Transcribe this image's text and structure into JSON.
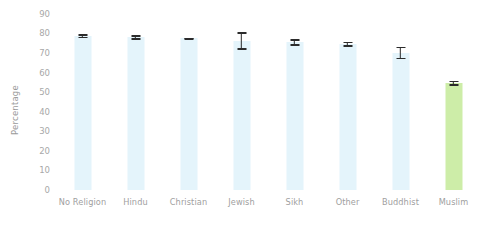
{
  "chart_data": {
    "type": "bar",
    "title": "",
    "subtitle": "",
    "xlabel": "",
    "ylabel": "Percentage",
    "ylim": [
      0,
      93
    ],
    "yticks": [
      0,
      10,
      20,
      30,
      40,
      50,
      60,
      70,
      80,
      90
    ],
    "ytick_labels": [
      "0",
      "10",
      "20",
      "30",
      "40",
      "50",
      "60",
      "70",
      "80",
      "90"
    ],
    "grid": false,
    "legend": "none",
    "categories": [
      "No Religion",
      "Hindu",
      "Christian",
      "Jewish",
      "Sikh",
      "Other",
      "Buddhist",
      "Muslim"
    ],
    "values": [
      78.5,
      78.0,
      77.5,
      76.0,
      75.5,
      74.5,
      70.0,
      54.5
    ],
    "error_low": [
      77.5,
      76.8,
      77.1,
      71.5,
      73.8,
      73.2,
      66.8,
      53.2
    ],
    "error_high": [
      79.5,
      79.2,
      77.9,
      80.5,
      77.2,
      75.8,
      73.2,
      55.8
    ],
    "bar_colors": [
      "#e4f4fb",
      "#e4f4fb",
      "#e4f4fb",
      "#e4f4fb",
      "#e4f4fb",
      "#e4f4fb",
      "#e4f4fb",
      "#cdeda8"
    ],
    "accent_color": "#cdeda8",
    "bar_color": "#e4f4fb",
    "errorbar_color": "#2b2b2b",
    "tick_label_color": "#a0a0a0",
    "axis_title_color": "#9a9a9a",
    "background_color": "#ffffff"
  }
}
